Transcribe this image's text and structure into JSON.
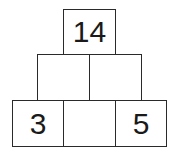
{
  "pyramid": {
    "top": {
      "value": "14"
    },
    "middle": [
      {
        "value": ""
      },
      {
        "value": ""
      }
    ],
    "bottom": [
      {
        "value": "3"
      },
      {
        "value": ""
      },
      {
        "value": "5"
      }
    ]
  }
}
